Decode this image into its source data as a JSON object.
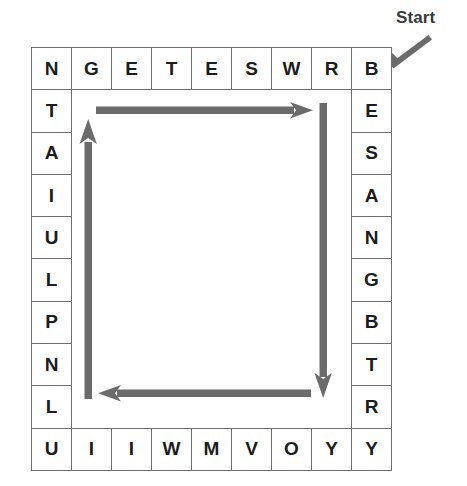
{
  "annotation": {
    "start_label": "Start",
    "start_arrow_icon": "diagonal-arrow-down-left-icon",
    "arrow_color": "#6b6b6b"
  },
  "grid": {
    "columns": 9,
    "rows": 10,
    "border_color": "#6e6e6e",
    "letter_color": "#1c1c1c",
    "cells": [
      [
        "N",
        "G",
        "E",
        "T",
        "E",
        "S",
        "W",
        "R",
        "B"
      ],
      [
        "T",
        "",
        "",
        "",
        "",
        "",
        "",
        "",
        "E"
      ],
      [
        "A",
        "",
        "",
        "",
        "",
        "",
        "",
        "",
        "S"
      ],
      [
        "I",
        "",
        "",
        "",
        "",
        "",
        "",
        "",
        "A"
      ],
      [
        "U",
        "",
        "",
        "",
        "",
        "",
        "",
        "",
        "N"
      ],
      [
        "L",
        "",
        "",
        "",
        "",
        "",
        "",
        "",
        "G"
      ],
      [
        "P",
        "",
        "",
        "",
        "",
        "",
        "",
        "",
        "B"
      ],
      [
        "N",
        "",
        "",
        "",
        "",
        "",
        "",
        "",
        "T"
      ],
      [
        "L",
        "",
        "",
        "",
        "",
        "",
        "",
        "",
        "R"
      ],
      [
        "U",
        "I",
        "I",
        "W",
        "M",
        "V",
        "O",
        "Y",
        "Y"
      ]
    ],
    "top_row": [
      "N",
      "G",
      "E",
      "T",
      "E",
      "S",
      "W",
      "R",
      "B"
    ],
    "left_column": [
      "N",
      "T",
      "A",
      "I",
      "U",
      "L",
      "P",
      "N",
      "L",
      "U"
    ],
    "right_column": [
      "B",
      "E",
      "S",
      "A",
      "N",
      "G",
      "B",
      "T",
      "R",
      "Y"
    ],
    "bottom_row": [
      "U",
      "I",
      "I",
      "W",
      "M",
      "V",
      "O",
      "Y",
      "Y"
    ]
  },
  "path_arrows": [
    {
      "name": "arrow-right-top",
      "direction": "right",
      "from_x": 96,
      "from_y": 110,
      "to_x": 312,
      "to_y": 110
    },
    {
      "name": "arrow-down-right",
      "direction": "down",
      "from_x": 323,
      "from_y": 103,
      "to_x": 323,
      "to_y": 398
    },
    {
      "name": "arrow-left-bottom",
      "direction": "left",
      "from_x": 311,
      "from_y": 393,
      "to_x": 99,
      "to_y": 393
    },
    {
      "name": "arrow-up-left",
      "direction": "up",
      "from_x": 88,
      "from_y": 399,
      "to_x": 88,
      "to_y": 119
    }
  ]
}
